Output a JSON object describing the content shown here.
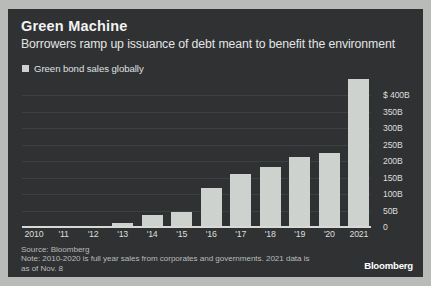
{
  "header": {
    "title": "Green Machine",
    "subtitle": "Borrowers ramp up issuance of debt meant to benefit the environment"
  },
  "legend": {
    "label": "Green bond sales globally",
    "swatch_color": "#ced2ce"
  },
  "footnote": {
    "source": "Source: Bloomberg",
    "note_line1": "Note: 2010-2020 is full year sales from corporates and governments. 2021 data is",
    "note_line2": "as of Nov. 8"
  },
  "brand": "Bloomberg",
  "theme": {
    "background": "#2f3133",
    "page_background": "#b9bbb8",
    "bar_color": "#ced2ce",
    "text_color": "#dcdedd",
    "gridline_color": "#3d4042"
  },
  "chart_data": {
    "type": "bar",
    "title": "Green Machine",
    "subtitle": "Borrowers ramp up issuance of debt meant to benefit the environment",
    "xlabel": "",
    "ylabel": "",
    "unit": "USD billions",
    "categories": [
      "2010",
      "'11",
      "'12",
      "'13",
      "'14",
      "'15",
      "'16",
      "'17",
      "'18",
      "'19",
      "'20",
      "2021"
    ],
    "values": [
      4,
      2,
      3,
      12,
      37,
      46,
      118,
      162,
      182,
      212,
      225,
      450
    ],
    "series": [
      {
        "name": "Green bond sales globally",
        "values": [
          4,
          2,
          3,
          12,
          37,
          46,
          118,
          162,
          182,
          212,
          225,
          450
        ]
      }
    ],
    "ylim": [
      0,
      450
    ],
    "yticks": [
      0,
      50,
      100,
      150,
      200,
      250,
      300,
      350,
      400
    ],
    "ytick_labels": [
      "0",
      "50B",
      "100B",
      "150B",
      "200B",
      "250B",
      "300B",
      "350B",
      "$ 400B"
    ],
    "grid": true,
    "legend_position": "top-left"
  }
}
